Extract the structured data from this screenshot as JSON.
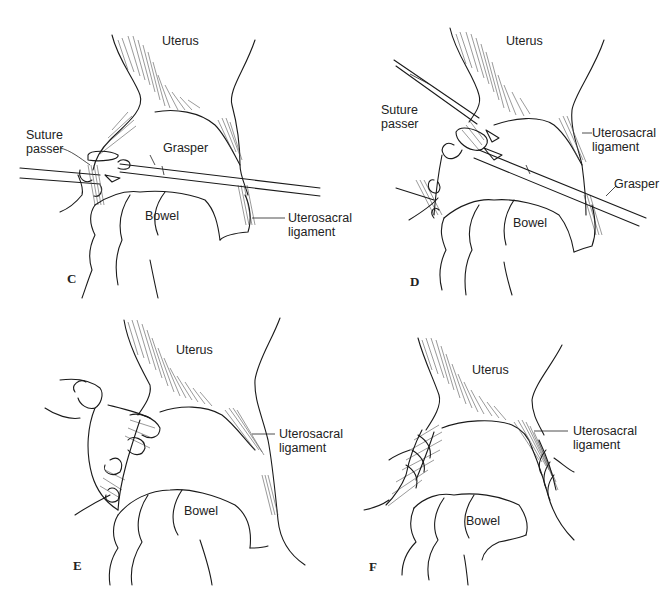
{
  "figure": {
    "panels": [
      {
        "letter": "C",
        "labels": {
          "uterus": "Uterus",
          "suture_passer_1": "Suture",
          "suture_passer_2": "passer",
          "grasper": "Grasper",
          "bowel": "Bowel",
          "ligament_1": "Uterosacral",
          "ligament_2": "ligament"
        }
      },
      {
        "letter": "D",
        "labels": {
          "uterus": "Uterus",
          "suture_passer_1": "Suture",
          "suture_passer_2": "passer",
          "grasper": "Grasper",
          "bowel": "Bowel",
          "ligament_1": "Uterosacral",
          "ligament_2": "ligament"
        }
      },
      {
        "letter": "E",
        "labels": {
          "uterus": "Uterus",
          "bowel": "Bowel",
          "ligament_1": "Uterosacral",
          "ligament_2": "ligament"
        }
      },
      {
        "letter": "F",
        "labels": {
          "uterus": "Uterus",
          "bowel": "Bowel",
          "ligament_1": "Uterosacral",
          "ligament_2": "ligament"
        }
      }
    ]
  }
}
